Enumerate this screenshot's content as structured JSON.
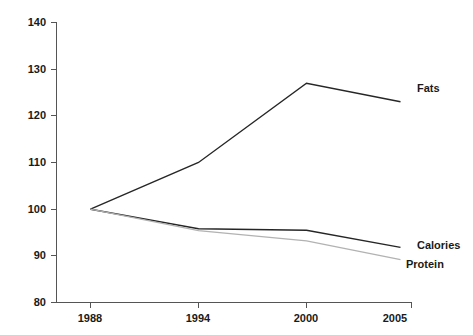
{
  "chart_data": {
    "type": "line",
    "title": "",
    "subtitle": "",
    "xlabel": "",
    "ylabel": "",
    "categories": [
      "1988",
      "1994",
      "2000",
      "2005"
    ],
    "x": [
      1988,
      1994,
      2000,
      2005
    ],
    "xlim": [
      1988,
      2005
    ],
    "ylim": [
      80,
      140
    ],
    "y_ticks": [
      80,
      90,
      100,
      110,
      120,
      130,
      140
    ],
    "x_ticks": [
      "1988",
      "1994",
      "2000",
      "2005"
    ],
    "grid": false,
    "legend_position": "right-inline-labels",
    "series": [
      {
        "name": "Fats",
        "values": [
          100,
          110,
          127,
          123
        ],
        "color": "#262626",
        "line_width": 1.4,
        "label": "Fats"
      },
      {
        "name": "Calories",
        "values": [
          100,
          95.8,
          95.5,
          91.8
        ],
        "color": "#262626",
        "line_width": 1.4,
        "label": "Calories"
      },
      {
        "name": "Protein",
        "values": [
          100,
          95.4,
          93.2,
          89.2
        ],
        "color": "#b2b2b2",
        "line_width": 1.3,
        "label": "Protein"
      }
    ]
  },
  "axis": {
    "y_tick_labels": [
      "140",
      "130",
      "120",
      "110",
      "100",
      "90",
      "80"
    ],
    "x_tick_labels": [
      "1988",
      "1994",
      "2000",
      "2005"
    ]
  },
  "labels": {
    "fats": "Fats",
    "calories": "Calories",
    "protein": "Protein"
  },
  "colors": {
    "axis": "#555555",
    "text": "#1a1a1a",
    "dark_series": "#262626",
    "light_series": "#b2b2b2",
    "background": "#ffffff"
  }
}
